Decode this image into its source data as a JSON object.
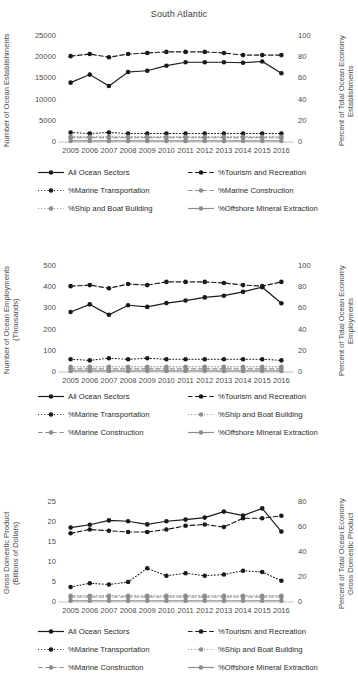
{
  "title": "South Atlantic",
  "years": [
    2005,
    2006,
    2007,
    2008,
    2009,
    2010,
    2011,
    2012,
    2013,
    2014,
    2015,
    2016
  ],
  "series_names": {
    "all": "All Ocean Sectors",
    "tourism": "%Tourism and Recreation",
    "transport": "%Marine Transportation",
    "construction": "%Marine Construction",
    "ship": "%Ship and Boat Building",
    "mineral": "%Offshore Mineral Extraction"
  },
  "colors": {
    "black": "#1a1a1a",
    "gray": "#8d8d8d",
    "axis": "#b3b3b3",
    "text": "#4a4a49"
  },
  "chart_data": [
    {
      "type": "line",
      "id": "establishments",
      "title": "South Atlantic",
      "xlabel": "",
      "ylabel": "Number of Ocean Establishments",
      "y2label": "Percent of Total Ocean Economy Establishments",
      "x": [
        2005,
        2006,
        2007,
        2008,
        2009,
        2010,
        2011,
        2012,
        2013,
        2014,
        2015,
        2016
      ],
      "ylim": [
        0,
        25000
      ],
      "yticks": [
        0,
        5000,
        10000,
        15000,
        20000,
        25000
      ],
      "y2lim": [
        0,
        100
      ],
      "y2ticks": [
        0,
        20,
        40,
        60,
        80,
        100
      ],
      "grid": false,
      "legend_position": "below",
      "series": [
        {
          "name": "All Ocean Sectors",
          "axis": "left",
          "style": "solid",
          "color": "#1a1a1a",
          "values": [
            14000,
            15900,
            13200,
            16500,
            16800,
            18000,
            18800,
            18800,
            18800,
            18700,
            19000,
            16200
          ]
        },
        {
          "name": "%Tourism and Recreation",
          "axis": "right",
          "style": "dashed",
          "color": "#1a1a1a",
          "values": [
            81,
            83,
            80,
            83,
            84,
            85,
            85,
            85,
            84,
            82,
            82,
            82
          ]
        },
        {
          "name": "%Marine Transportation",
          "axis": "right",
          "style": "dotted",
          "color": "#1a1a1a",
          "values": [
            9,
            8,
            9,
            8,
            8,
            8,
            8,
            8,
            8,
            8,
            8,
            8
          ]
        },
        {
          "name": "%Marine Construction",
          "axis": "right",
          "style": "dashed",
          "color": "#8d8d8d",
          "values": [
            4,
            4,
            4,
            4,
            4,
            4,
            4,
            4,
            4,
            4,
            4,
            4
          ]
        },
        {
          "name": "%Ship and Boat Building",
          "axis": "right",
          "style": "dotted",
          "color": "#8d8d8d",
          "values": [
            5,
            5,
            5,
            5,
            5,
            5,
            5,
            5,
            5,
            5,
            5,
            5
          ]
        },
        {
          "name": "%Offshore Mineral Extraction",
          "axis": "right",
          "style": "solid",
          "color": "#8d8d8d",
          "values": [
            1,
            1,
            1,
            1,
            1,
            1,
            1,
            1,
            1,
            1,
            1,
            1
          ]
        }
      ],
      "legend": [
        [
          "All Ocean Sectors",
          "%Tourism and Recreation"
        ],
        [
          "%Marine Transportation",
          "%Marine Construction"
        ],
        [
          "%Ship and Boat Building",
          "%Offshore Mineral Extraction"
        ]
      ]
    },
    {
      "type": "line",
      "id": "employments",
      "title": "",
      "xlabel": "",
      "ylabel": "Number of Ocean Employments\n(Thousands)",
      "y2label": "Percent of Total Ocean Economy Employments",
      "x": [
        2005,
        2006,
        2007,
        2008,
        2009,
        2010,
        2011,
        2012,
        2013,
        2014,
        2015,
        2016
      ],
      "ylim": [
        0,
        500
      ],
      "yticks": [
        0,
        100,
        200,
        300,
        400,
        500
      ],
      "y2lim": [
        0,
        100
      ],
      "y2ticks": [
        0,
        20,
        40,
        60,
        80,
        100
      ],
      "grid": false,
      "legend_position": "below",
      "series": [
        {
          "name": "All Ocean Sectors",
          "axis": "left",
          "style": "solid",
          "color": "#1a1a1a",
          "values": [
            283,
            319,
            270,
            315,
            307,
            325,
            337,
            352,
            360,
            378,
            400,
            324
          ]
        },
        {
          "name": "%Tourism and Recreation",
          "axis": "right",
          "style": "dashed",
          "color": "#1a1a1a",
          "values": [
            81,
            82,
            79,
            83,
            82,
            85,
            85,
            85,
            84,
            82,
            81,
            85
          ]
        },
        {
          "name": "%Marine Transportation",
          "axis": "right",
          "style": "dotted",
          "color": "#1a1a1a",
          "values": [
            12,
            11,
            13,
            12,
            13,
            12,
            12,
            12,
            12,
            12,
            12,
            11
          ]
        },
        {
          "name": "%Ship and Boat Building",
          "axis": "right",
          "style": "dotted",
          "color": "#8d8d8d",
          "values": [
            5,
            5,
            5,
            5,
            5,
            5,
            5,
            5,
            5,
            5,
            5,
            5
          ]
        },
        {
          "name": "%Marine Construction",
          "axis": "right",
          "style": "dashed",
          "color": "#8d8d8d",
          "values": [
            3,
            3,
            3,
            3,
            3,
            3,
            3,
            3,
            3,
            3,
            3,
            3
          ]
        },
        {
          "name": "%Offshore Mineral Extraction",
          "axis": "right",
          "style": "solid",
          "color": "#8d8d8d",
          "values": [
            1,
            1,
            1,
            1,
            1,
            1,
            1,
            1,
            1,
            1,
            1,
            1
          ]
        }
      ],
      "legend": [
        [
          "All Ocean Sectors",
          "%Tourism and Recreation"
        ],
        [
          "%Marine Transportation",
          "%Ship and Boat Building"
        ],
        [
          "%Marine Construction",
          "%Offshore Mineral Extraction"
        ]
      ]
    },
    {
      "type": "line",
      "id": "gdp",
      "title": "",
      "xlabel": "",
      "ylabel": "Gross Domestic Product\n(Billions of Dollars)",
      "y2label": "Percent of Total Ocean Economy Gross Domestic Product",
      "x": [
        2005,
        2006,
        2007,
        2008,
        2009,
        2010,
        2011,
        2012,
        2013,
        2014,
        2015,
        2016
      ],
      "ylim": [
        0,
        25
      ],
      "yticks": [
        0,
        5,
        10,
        15,
        20,
        25
      ],
      "y2lim": [
        0,
        80
      ],
      "y2ticks": [
        0,
        20,
        40,
        60,
        80
      ],
      "grid": false,
      "legend_position": "below",
      "series": [
        {
          "name": "All Ocean Sectors",
          "axis": "left",
          "style": "solid",
          "color": "#1a1a1a",
          "values": [
            18.6,
            19.3,
            20.4,
            20.2,
            19.4,
            20.2,
            20.6,
            21.1,
            22.6,
            21.6,
            23.4,
            17.6
          ]
        },
        {
          "name": "%Tourism and Recreation",
          "axis": "right",
          "style": "dashed",
          "color": "#1a1a1a",
          "values": [
            55,
            58,
            57,
            56,
            56,
            58,
            61,
            62,
            60,
            67,
            67,
            69
          ]
        },
        {
          "name": "%Marine Transportation",
          "axis": "right",
          "style": "dotted",
          "color": "#1a1a1a",
          "values": [
            12,
            15,
            14,
            16,
            27,
            21,
            23,
            21,
            22,
            25,
            24,
            17
          ]
        },
        {
          "name": "%Ship and Boat Building",
          "axis": "right",
          "style": "dotted",
          "color": "#8d8d8d",
          "values": [
            5,
            5,
            5,
            5,
            5,
            5,
            5,
            5,
            5,
            5,
            5,
            5
          ]
        },
        {
          "name": "%Marine Construction",
          "axis": "right",
          "style": "dashed",
          "color": "#8d8d8d",
          "values": [
            4,
            4,
            4,
            4,
            4,
            4,
            4,
            4,
            4,
            4,
            4,
            4
          ]
        },
        {
          "name": "%Offshore Mineral Extraction",
          "axis": "right",
          "style": "solid",
          "color": "#8d8d8d",
          "values": [
            1,
            1,
            1,
            1,
            1,
            1,
            1,
            1,
            1,
            1,
            1,
            1
          ]
        }
      ],
      "legend": [
        [
          "All Ocean Sectors",
          "%Tourism and Recreation"
        ],
        [
          "%Marine Transportation",
          "%Ship and Boat Building"
        ],
        [
          "%Marine Construction",
          "%Offshore Mineral Extraction"
        ]
      ]
    }
  ]
}
